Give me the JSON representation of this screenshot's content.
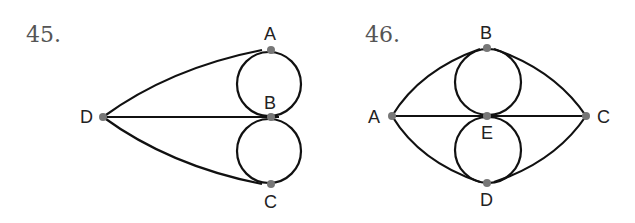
{
  "figures": [
    {
      "number": "45.",
      "vertices": [
        {
          "label": "A",
          "x": 271,
          "y": 50
        },
        {
          "label": "B",
          "x": 271,
          "y": 117
        },
        {
          "label": "C",
          "x": 271,
          "y": 184
        },
        {
          "label": "D",
          "x": 103,
          "y": 117
        }
      ],
      "edges": [
        [
          "D",
          "A"
        ],
        [
          "D",
          "B"
        ],
        [
          "D",
          "C"
        ],
        [
          "A",
          "B",
          "loop-left"
        ],
        [
          "A",
          "B",
          "loop-right"
        ],
        [
          "B",
          "C",
          "loop-left"
        ],
        [
          "B",
          "C",
          "loop-right"
        ]
      ]
    },
    {
      "number": "46.",
      "vertices": [
        {
          "label": "A",
          "x": 392,
          "y": 116
        },
        {
          "label": "B",
          "x": 487,
          "y": 48
        },
        {
          "label": "C",
          "x": 586,
          "y": 116
        },
        {
          "label": "D",
          "x": 487,
          "y": 183
        },
        {
          "label": "E",
          "x": 487,
          "y": 116
        }
      ],
      "edges": [
        [
          "A",
          "B"
        ],
        [
          "B",
          "C"
        ],
        [
          "A",
          "D"
        ],
        [
          "D",
          "C"
        ],
        [
          "A",
          "E"
        ],
        [
          "E",
          "C"
        ],
        [
          "B",
          "E",
          "loop-left"
        ],
        [
          "B",
          "E",
          "loop-right"
        ],
        [
          "E",
          "D",
          "loop-left"
        ],
        [
          "E",
          "D",
          "loop-right"
        ]
      ]
    }
  ],
  "colors": {
    "edge": "#111111",
    "vertex": "#777777",
    "number": "#555555"
  }
}
